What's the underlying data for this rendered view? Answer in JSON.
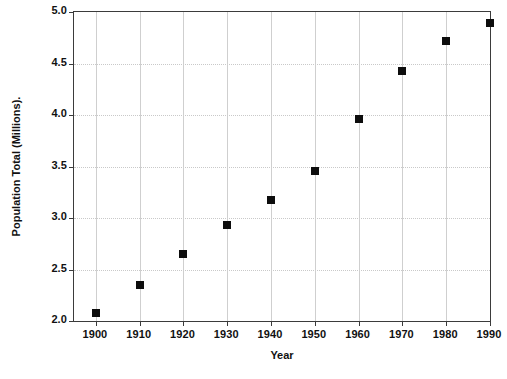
{
  "chart_data": {
    "type": "scatter",
    "title": "",
    "xlabel": "Year",
    "ylabel": "Population Total (Millions).",
    "xlim": [
      1895,
      1990
    ],
    "ylim": [
      2.0,
      5.0
    ],
    "grid": true,
    "legend": null,
    "marker": "filled-square",
    "marker_color": "#0d0d0d",
    "categories": [
      1900,
      1910,
      1920,
      1930,
      1940,
      1950,
      1960,
      1970,
      1980,
      1990
    ],
    "values": [
      2.08,
      2.35,
      2.65,
      2.93,
      3.17,
      3.46,
      3.96,
      4.43,
      4.72,
      4.89
    ],
    "x": [
      1900,
      1910,
      1920,
      1930,
      1940,
      1950,
      1960,
      1970,
      1980,
      1990
    ],
    "y": [
      2.08,
      2.35,
      2.65,
      2.93,
      3.17,
      3.46,
      3.96,
      4.43,
      4.72,
      4.89
    ],
    "xticks": [
      "1900",
      "1910",
      "1920",
      "1930",
      "1940",
      "1950",
      "1960",
      "1970",
      "1980",
      "1990"
    ],
    "yticks": [
      "2.0",
      "2.5",
      "3.0",
      "3.5",
      "4.0",
      "4.5",
      "5.0"
    ],
    "ytick_values": [
      2.0,
      2.5,
      3.0,
      3.5,
      4.0,
      4.5,
      5.0
    ]
  },
  "axes": {
    "x_title": "Year",
    "y_title": "Population Total (Millions)."
  },
  "caption": {
    "text": ""
  }
}
